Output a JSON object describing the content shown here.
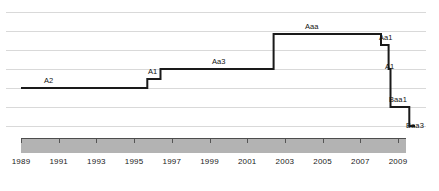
{
  "chart_data": {
    "type": "line",
    "title": "",
    "xlabel": "",
    "ylabel": "",
    "subtype": "step",
    "grid": true,
    "legend": "none",
    "xlim": [
      1989,
      2010
    ],
    "x_tick_labels": [
      "1989",
      "1991",
      "1993",
      "1995",
      "1997",
      "1999",
      "2001",
      "2003",
      "2005",
      "2007",
      "2009"
    ],
    "x_ticks": [
      1989,
      1991,
      1993,
      1995,
      1997,
      1999,
      2001,
      2003,
      2005,
      2007,
      2009
    ],
    "y_categories": [
      "Aaa",
      "Aa1",
      "Aa3",
      "A1",
      "A2",
      "Baa1",
      "Baa3"
    ],
    "y_axis_type": "credit-rating-ordinal",
    "series": [
      {
        "name": "Credit rating",
        "color": "#1a1a1a",
        "steps": [
          {
            "x_start": 1989.0,
            "x_end": 1995.7,
            "rating": "A2"
          },
          {
            "x_start": 1995.7,
            "x_end": 1996.4,
            "rating": "A1"
          },
          {
            "x_start": 1996.4,
            "x_end": 2002.4,
            "rating": "Aa3"
          },
          {
            "x_start": 2002.4,
            "x_end": 2008.1,
            "rating": "Aaa"
          },
          {
            "x_start": 2008.1,
            "x_end": 2008.5,
            "rating": "Aa1"
          },
          {
            "x_start": 2008.5,
            "x_end": 2008.6,
            "rating": "A1"
          },
          {
            "x_start": 2008.6,
            "x_end": 2009.6,
            "rating": "Baa1"
          },
          {
            "x_start": 2009.6,
            "x_end": 2009.9,
            "rating": "Baa3"
          }
        ]
      }
    ],
    "annotations": [
      {
        "text": "A2",
        "x": 1992.2,
        "rating": "A2",
        "position": "above"
      },
      {
        "text": "A1",
        "x": 1995.8,
        "rating": "A1",
        "position": "above"
      },
      {
        "text": "Aa3",
        "x": 1999.3,
        "rating": "Aa3",
        "position": "above"
      },
      {
        "text": "Aaa",
        "x": 2005.2,
        "rating": "Aaa",
        "position": "above"
      },
      {
        "text": "Aa1",
        "x": 2008.6,
        "rating": "Aa1",
        "position": "right"
      },
      {
        "text": "A1",
        "x": 2008.8,
        "rating": "A1",
        "position": "right"
      },
      {
        "text": "Baa1",
        "x": 2008.9,
        "rating": "Baa1",
        "position": "right"
      },
      {
        "text": "Baa3",
        "x": 2010.0,
        "rating": "Baa3",
        "position": "right"
      }
    ],
    "colors": {
      "line": "#1a1a1a",
      "grid": "#d9d9d9",
      "axis_band": "#b3b3b3",
      "axis_line": "#4d4d4d",
      "text": "#111111"
    }
  }
}
